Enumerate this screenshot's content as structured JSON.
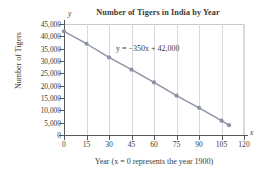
{
  "chart_data": {
    "type": "line",
    "title": "Number of Tigers in India by Year",
    "xlabel": "Year (x = 0 represents the year 1900)",
    "ylabel": "Number of Tigers",
    "annotation": "y = −350x + 42,000",
    "x": [
      0,
      15,
      30,
      45,
      60,
      75,
      90,
      105,
      110
    ],
    "values": [
      42000,
      37000,
      31500,
      26500,
      21300,
      16000,
      11000,
      5800,
      4000
    ],
    "series": [
      {
        "name": "Number of Tigers",
        "values": [
          42000,
          37000,
          31500,
          26500,
          21300,
          16000,
          11000,
          5800,
          4000
        ]
      }
    ],
    "xlim": [
      0,
      120
    ],
    "ylim": [
      0,
      45000
    ],
    "xticks": [
      0,
      15,
      30,
      45,
      60,
      75,
      90,
      105,
      120
    ],
    "yticks": [
      0,
      5000,
      10000,
      15000,
      20000,
      25000,
      30000,
      35000,
      40000,
      45000
    ],
    "xtick_labels": [
      "0",
      "15",
      "30",
      "45",
      "60",
      "75",
      "90",
      "105",
      "120"
    ],
    "ytick_labels": [
      "0",
      "5,000",
      "10,000",
      "15,000",
      "20,000",
      "25,000",
      "30,000",
      "35,000",
      "40,000",
      "45,000"
    ],
    "grid": "vertical",
    "legend": "none",
    "axis_letter_x": "x",
    "axis_letter_y": "y",
    "colors": {
      "line": "#8c92a6",
      "marker": "#8c92a6",
      "grid": "#d8d8de",
      "axis": "#585858",
      "text": "#3a3a3a",
      "background": "#ffffff"
    }
  }
}
